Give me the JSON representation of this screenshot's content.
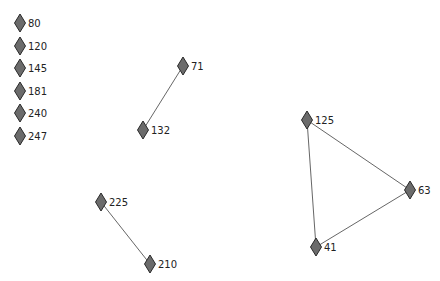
{
  "graph": {
    "node_fill": "#6b6b6b",
    "node_stroke": "#2a2a2a",
    "edge_color": "#555555",
    "nodes": [
      {
        "id": "80",
        "label": "80",
        "x": 20,
        "y": 23
      },
      {
        "id": "120",
        "label": "120",
        "x": 20,
        "y": 46
      },
      {
        "id": "145",
        "label": "145",
        "x": 20,
        "y": 68
      },
      {
        "id": "181",
        "label": "181",
        "x": 20,
        "y": 91
      },
      {
        "id": "240",
        "label": "240",
        "x": 20,
        "y": 113
      },
      {
        "id": "247",
        "label": "247",
        "x": 20,
        "y": 136
      },
      {
        "id": "71",
        "label": "71",
        "x": 183,
        "y": 66
      },
      {
        "id": "132",
        "label": "132",
        "x": 143,
        "y": 130
      },
      {
        "id": "125",
        "label": "125",
        "x": 307,
        "y": 120
      },
      {
        "id": "63",
        "label": "63",
        "x": 410,
        "y": 190
      },
      {
        "id": "41",
        "label": "41",
        "x": 316,
        "y": 247
      },
      {
        "id": "225",
        "label": "225",
        "x": 101,
        "y": 202
      },
      {
        "id": "210",
        "label": "210",
        "x": 150,
        "y": 264
      }
    ],
    "edges": [
      {
        "source": "71",
        "target": "132"
      },
      {
        "source": "125",
        "target": "63"
      },
      {
        "source": "125",
        "target": "41"
      },
      {
        "source": "63",
        "target": "41"
      },
      {
        "source": "225",
        "target": "210"
      }
    ]
  }
}
